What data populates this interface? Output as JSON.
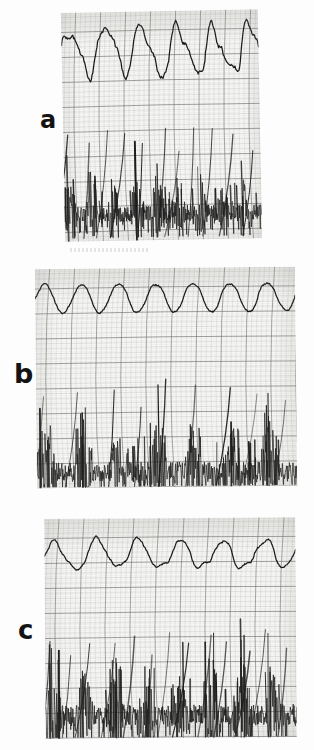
{
  "figure": {
    "type": "scanned-physiological-recording",
    "panel_count": 3,
    "background_color": "#fdfdfd",
    "ink_color": "#1a1a1a",
    "grid_color": "#6c6c68",
    "paper_color": "#f6f6f4"
  },
  "panels": [
    {
      "id": "a",
      "label": "a",
      "label_x": 40,
      "label_y": 108,
      "label_size": 24,
      "x": 63,
      "y": 11,
      "w": 197,
      "h": 229,
      "rotation": -1.1,
      "traces": [
        {
          "name": "slow-wave-trace",
          "kind": "irregular-slow-wave",
          "band_top": 0.03,
          "band_bottom": 0.44,
          "baseline": 0.36,
          "amplitude": 0.22,
          "cycles": 5.5,
          "irregularity": 0.55,
          "plateau": 0.6,
          "seed": 11
        },
        {
          "name": "burst-neurogram-trace",
          "kind": "burst-spikes",
          "band_top": 0.46,
          "band_bottom": 0.99,
          "baseline": 0.8,
          "bursts": 9,
          "spike_density": 0.52,
          "spike_height": 0.42,
          "tail_streaks": 11,
          "seed": 23
        }
      ]
    },
    {
      "id": "b",
      "label": "b",
      "label_x": 14,
      "label_y": 360,
      "label_size": 27,
      "x": 36,
      "y": 268,
      "w": 260,
      "h": 219,
      "rotation": -0.6,
      "traces": [
        {
          "name": "slow-wave-trace",
          "kind": "regular-sine-wave",
          "band_top": 0.04,
          "band_bottom": 0.42,
          "baseline": 0.25,
          "amplitude": 0.17,
          "cycles": 7,
          "irregularity": 0.1,
          "plateau": 0.2,
          "seed": 5
        },
        {
          "name": "burst-neurogram-trace",
          "kind": "burst-spikes",
          "band_top": 0.48,
          "band_bottom": 1.0,
          "baseline": 0.86,
          "bursts": 7,
          "spike_density": 0.7,
          "spike_height": 0.55,
          "tail_streaks": 9,
          "seed": 37
        }
      ]
    },
    {
      "id": "c",
      "label": "c",
      "label_x": 18,
      "label_y": 617,
      "label_size": 26,
      "x": 45,
      "y": 518,
      "w": 251,
      "h": 220,
      "rotation": -0.4,
      "traces": [
        {
          "name": "slow-wave-trace",
          "kind": "semi-regular-wave",
          "band_top": 0.06,
          "band_bottom": 0.44,
          "baseline": 0.28,
          "amplitude": 0.16,
          "cycles": 6,
          "irregularity": 0.32,
          "plateau": 0.35,
          "seed": 71
        },
        {
          "name": "burst-neurogram-trace",
          "kind": "burst-spikes",
          "band_top": 0.48,
          "band_bottom": 1.0,
          "baseline": 0.8,
          "bursts": 8,
          "spike_density": 0.66,
          "spike_height": 0.6,
          "tail_streaks": 13,
          "seed": 89
        }
      ]
    }
  ],
  "grid": {
    "minor_spacing": 5,
    "major_every": 5,
    "curved": true,
    "curvature": 0.22,
    "minor_opacity": 0.3,
    "major_opacity": 0.72
  },
  "artifacts": [
    {
      "name": "scan-smudge",
      "x": 70,
      "y": 248,
      "w": 80,
      "h": 4
    }
  ]
}
